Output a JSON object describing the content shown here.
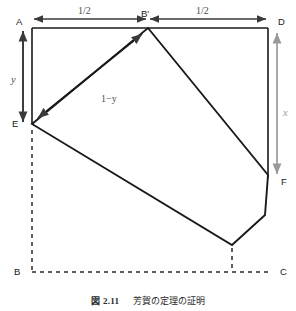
{
  "figure": {
    "caption_number": "図 2.11",
    "caption_text": "芳賀の定理の証明",
    "colors": {
      "ink": "#1a1a1a",
      "dimension_dark": "#3a3a3a",
      "dimension_gray": "#9a9a9a",
      "label_gray": "#4d4d4d",
      "background": "#ffffff"
    }
  },
  "vertices": [
    {
      "id": "A",
      "label": "A",
      "x": 32,
      "y": 28,
      "label_x": 16,
      "label_y": 17
    },
    {
      "id": "Bp",
      "label": "B'",
      "x": 148,
      "y": 28,
      "label_x": 141,
      "label_y": 9
    },
    {
      "id": "D",
      "label": "D",
      "x": 268,
      "y": 28,
      "label_x": 278,
      "label_y": 17
    },
    {
      "id": "E",
      "label": "E",
      "x": 32,
      "y": 124,
      "label_x": 12,
      "label_y": 119
    },
    {
      "id": "F",
      "label": "F",
      "x": 268,
      "y": 175,
      "label_x": 281,
      "label_y": 177
    },
    {
      "id": "B",
      "label": "B",
      "x": 32,
      "y": 272,
      "label_x": 14,
      "label_y": 267
    },
    {
      "id": "C",
      "label": "C",
      "x": 268,
      "y": 272,
      "label_x": 280,
      "label_y": 267
    }
  ],
  "dimensions": [
    {
      "id": "half-left",
      "label": "1/2",
      "label_x": 78,
      "label_y": 6,
      "style": "plain",
      "tone": "dark"
    },
    {
      "id": "half-right",
      "label": "1/2",
      "label_x": 196,
      "label_y": 6,
      "style": "plain",
      "tone": "dark"
    },
    {
      "id": "y-left",
      "label": "y",
      "label_x": 11,
      "label_y": 75,
      "style": "italic",
      "tone": "dark"
    },
    {
      "id": "x-right",
      "label": "x",
      "label_x": 283,
      "label_y": 108,
      "style": "italic",
      "tone": "gray"
    },
    {
      "id": "one-minus-y",
      "label": "1−y",
      "label_x": 101,
      "label_y": 94,
      "style": "plain",
      "tone": "gray"
    }
  ],
  "shapes": {
    "square_solid_edges": "Top edge A-D and left edge A-E-B region drawn solid; bottom and right original edges dashed",
    "flap_polygon_points": "32,124 148,28 268,175 265,215 232,245",
    "crease_arrow": {
      "from_x": 38,
      "from_y": 118,
      "to_x": 142,
      "to_y": 34
    }
  }
}
